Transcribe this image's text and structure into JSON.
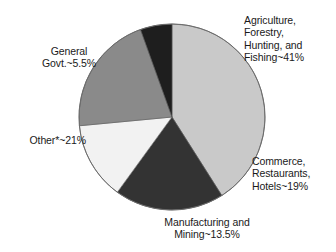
{
  "chart_data": {
    "type": "pie",
    "title": "",
    "subtitle": "",
    "xlabel": "",
    "ylabel": "",
    "legend_position": "none",
    "grid": false,
    "note": "Other*~21%",
    "categories": [
      "Agriculture, Forestry, Hunting, and Fishing",
      "Commerce, Restaurants, Hotels",
      "Manufacturing and Mining",
      "Other*",
      "General Govt."
    ],
    "values": [
      41,
      19,
      13.5,
      21,
      5.5
    ],
    "value_suffix": "%",
    "colors": [
      "#c9c9c9",
      "#333333",
      "#f2f2f2",
      "#8a8a8a",
      "#1e1e1e"
    ],
    "slices": [
      {
        "name": "agriculture-forestry-hunting-fishing",
        "label": "Agriculture,\nForestry,\nHunting, and\nFishing~41%",
        "value": 41,
        "color": "#c9c9c9",
        "start_angle": 0,
        "end_angle": 147.6
      },
      {
        "name": "commerce-restaurants-hotels",
        "label": "Commerce,\nRestaurants,\nHotels~19%",
        "value": 19,
        "color": "#333333",
        "start_angle": 147.6,
        "end_angle": 216.0
      },
      {
        "name": "manufacturing-and-mining",
        "label": "Manufacturing and\nMining~13.5%",
        "value": 13.5,
        "color": "#f2f2f2",
        "start_angle": 216.0,
        "end_angle": 264.6
      },
      {
        "name": "other",
        "label": "Other*~21%",
        "value": 21,
        "color": "#8a8a8a",
        "start_angle": 264.6,
        "end_angle": 340.2
      },
      {
        "name": "general-govt",
        "label": "General\nGovt.~5.5%",
        "value": 5.5,
        "color": "#1e1e1e",
        "start_angle": 340.2,
        "end_angle": 360
      }
    ],
    "geometry": {
      "center_x": 172,
      "center_y": 117,
      "radius": 93
    }
  },
  "labels": {
    "agriculture": "Agriculture,\nForestry,\nHunting, and\nFishing~41%",
    "commerce": "Commerce,\nRestaurants,\nHotels~19%",
    "manufacturing": "Manufacturing and\nMining~13.5%",
    "other": "Other*~21%",
    "general_govt": "General\nGovt.~5.5%"
  }
}
